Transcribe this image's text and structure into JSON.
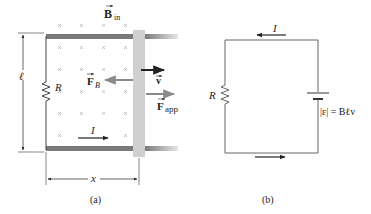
{
  "figure_a": {
    "field_label": "B",
    "field_subscript": "in",
    "resistor_label": "R",
    "length_label": "ℓ",
    "force_b_label": "F",
    "force_b_subscript": "B",
    "velocity_label": "v",
    "force_app_label": "F",
    "force_app_subscript": "app",
    "current_label": "I",
    "distance_label": "x",
    "caption": "(a)"
  },
  "figure_b": {
    "current_label": "I",
    "resistor_label": "R",
    "emf_label": "|ε| = Bℓv",
    "caption": "(b)"
  },
  "colors": {
    "rail": "#7a7a7a",
    "bar": "#cfcfcf",
    "arrow": "#222222",
    "gray_arrow": "#8a8a8a",
    "wire": "#555555"
  }
}
